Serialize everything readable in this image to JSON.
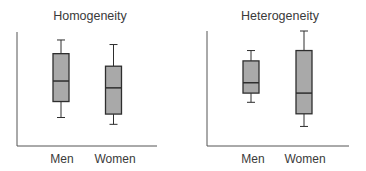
{
  "chart_data": [
    {
      "type": "boxplot",
      "title": "Homogeneity",
      "xlabel": "",
      "ylabel": "",
      "categories": [
        "Men",
        "Women"
      ],
      "ylim": [
        0,
        100
      ],
      "grid": false,
      "legend": null,
      "y_ticks": [],
      "series": [
        {
          "name": "Men",
          "min": 25,
          "q1": 39,
          "median": 57,
          "q3": 81,
          "max": 93
        },
        {
          "name": "Women",
          "min": 19,
          "q1": 28,
          "median": 51,
          "q3": 70,
          "max": 89
        }
      ]
    },
    {
      "type": "boxplot",
      "title": "Heterogeneity",
      "xlabel": "",
      "ylabel": "",
      "categories": [
        "Men",
        "Women"
      ],
      "ylim": [
        0,
        100
      ],
      "grid": false,
      "legend": null,
      "y_ticks": [],
      "series": [
        {
          "name": "Men",
          "min": 38,
          "q1": 46,
          "median": 55,
          "q3": 74,
          "max": 83
        },
        {
          "name": "Women",
          "min": 17,
          "q1": 28,
          "median": 46,
          "q3": 83,
          "max": 100
        }
      ]
    }
  ],
  "colors": {
    "box_fill": "#a9a9a9",
    "box_stroke": "#2e2e2e",
    "axis": "#555555",
    "text": "#3a3a3a"
  }
}
